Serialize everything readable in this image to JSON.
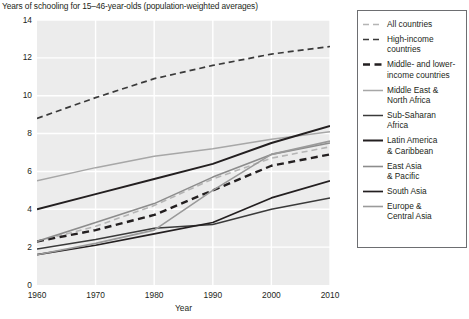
{
  "chart_data": {
    "type": "line",
    "title": "Years of schooling for 15–46-year-olds (population-weighted averages)",
    "xlabel": "Year",
    "ylabel": "",
    "xlim": [
      1960,
      2010
    ],
    "ylim": [
      0,
      14
    ],
    "xticks": [
      1960,
      1970,
      1980,
      1990,
      2000,
      2010
    ],
    "yticks": [
      0,
      2,
      4,
      6,
      8,
      10,
      12,
      14
    ],
    "grid": true,
    "legend_position": "right",
    "x": [
      1960,
      1970,
      1980,
      1990,
      2000,
      2010
    ],
    "series": [
      {
        "name": "All countries",
        "style": "dashed",
        "color": "#b5b5b5",
        "width": 1.6,
        "values": [
          2.3,
          3.1,
          4.2,
          5.6,
          6.7,
          7.3
        ]
      },
      {
        "name": "High-income countries",
        "style": "dashed",
        "color": "#3a3a3a",
        "width": 1.7,
        "values": [
          8.8,
          9.9,
          10.9,
          11.6,
          12.2,
          12.6
        ]
      },
      {
        "name": "Middle- and lower-income countries",
        "style": "dashed",
        "color": "#231f20",
        "width": 2.4,
        "values": [
          2.3,
          2.9,
          3.7,
          5.0,
          6.3,
          6.9
        ]
      },
      {
        "name": "Middle East & North Africa",
        "style": "solid",
        "color": "#a7a7a7",
        "width": 1.5,
        "values": [
          5.5,
          6.2,
          6.8,
          7.2,
          7.7,
          8.1
        ]
      },
      {
        "name": "Sub-Saharan Africa",
        "style": "solid",
        "color": "#3a3a3a",
        "width": 1.5,
        "values": [
          1.9,
          2.4,
          3.0,
          3.2,
          4.0,
          4.6
        ]
      },
      {
        "name": "Latin America & Caribbean",
        "style": "solid",
        "color": "#231f20",
        "width": 2.0,
        "values": [
          4.0,
          4.8,
          5.6,
          6.4,
          7.5,
          8.4
        ]
      },
      {
        "name": "East Asia & Pacific",
        "style": "solid",
        "color": "#8c8c8c",
        "width": 1.6,
        "values": [
          2.3,
          3.3,
          4.3,
          5.7,
          6.9,
          7.5
        ]
      },
      {
        "name": "South Asia",
        "style": "solid",
        "color": "#231f20",
        "width": 1.7,
        "values": [
          1.6,
          2.1,
          2.7,
          3.3,
          4.6,
          5.5
        ]
      },
      {
        "name": "Europe & Central Asia",
        "style": "solid",
        "color": "#9a9a9a",
        "width": 1.6,
        "values": [
          1.6,
          2.2,
          2.9,
          5.0,
          6.9,
          7.6
        ]
      }
    ]
  },
  "legend": {
    "entries": [
      "All countries",
      "High-income\ncountries",
      "Middle- and lower-\nincome countries",
      "Middle East &\nNorth Africa",
      "Sub-Saharan\nAfrica",
      "Latin America\n& Caribbean",
      "East Asia\n& Pacific",
      "South Asia",
      "Europe &\nCentral Asia"
    ]
  },
  "axes": {
    "y_tick_labels": [
      "14",
      "12",
      "10",
      "8",
      "6",
      "4",
      "2",
      "0"
    ],
    "x_tick_labels": [
      "1960",
      "1970",
      "1980",
      "1990",
      "2000",
      "2010"
    ],
    "x_axis_title": "Year"
  },
  "colors": {
    "plot_background": "#ececec",
    "gridline": "#ffffff",
    "text": "#231f20",
    "legend_border": "#6d6e71"
  }
}
